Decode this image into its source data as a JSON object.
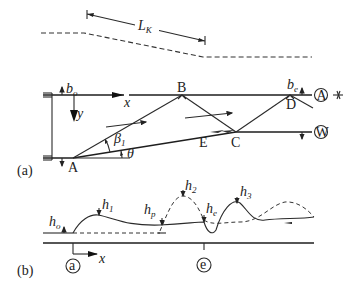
{
  "figure": {
    "top_profile": {
      "length_label": "L",
      "length_sub": "K"
    },
    "panel_a": {
      "panel_label": "(a)",
      "points": {
        "A": "A",
        "B": "B",
        "C": "C",
        "D": "D",
        "E": "E"
      },
      "axes": {
        "x": "x",
        "y": "y"
      },
      "angles": {
        "beta": "β",
        "beta_sub": "1",
        "theta": "θ"
      },
      "widths": {
        "b0": "b",
        "b0_sub": "o",
        "be": "b",
        "be_sub": "e"
      },
      "circled": {
        "top_wall": "A",
        "bottom_wall": "W"
      }
    },
    "panel_b": {
      "panel_label": "(b)",
      "heights": [
        {
          "base": "h",
          "sub": "o"
        },
        {
          "base": "h",
          "sub": "1"
        },
        {
          "base": "h",
          "sub": "p"
        },
        {
          "base": "h",
          "sub": "2"
        },
        {
          "base": "h",
          "sub": "e"
        },
        {
          "base": "h",
          "sub": "3"
        }
      ],
      "axis": "x",
      "stations": {
        "start": "a",
        "end": "e"
      }
    }
  }
}
